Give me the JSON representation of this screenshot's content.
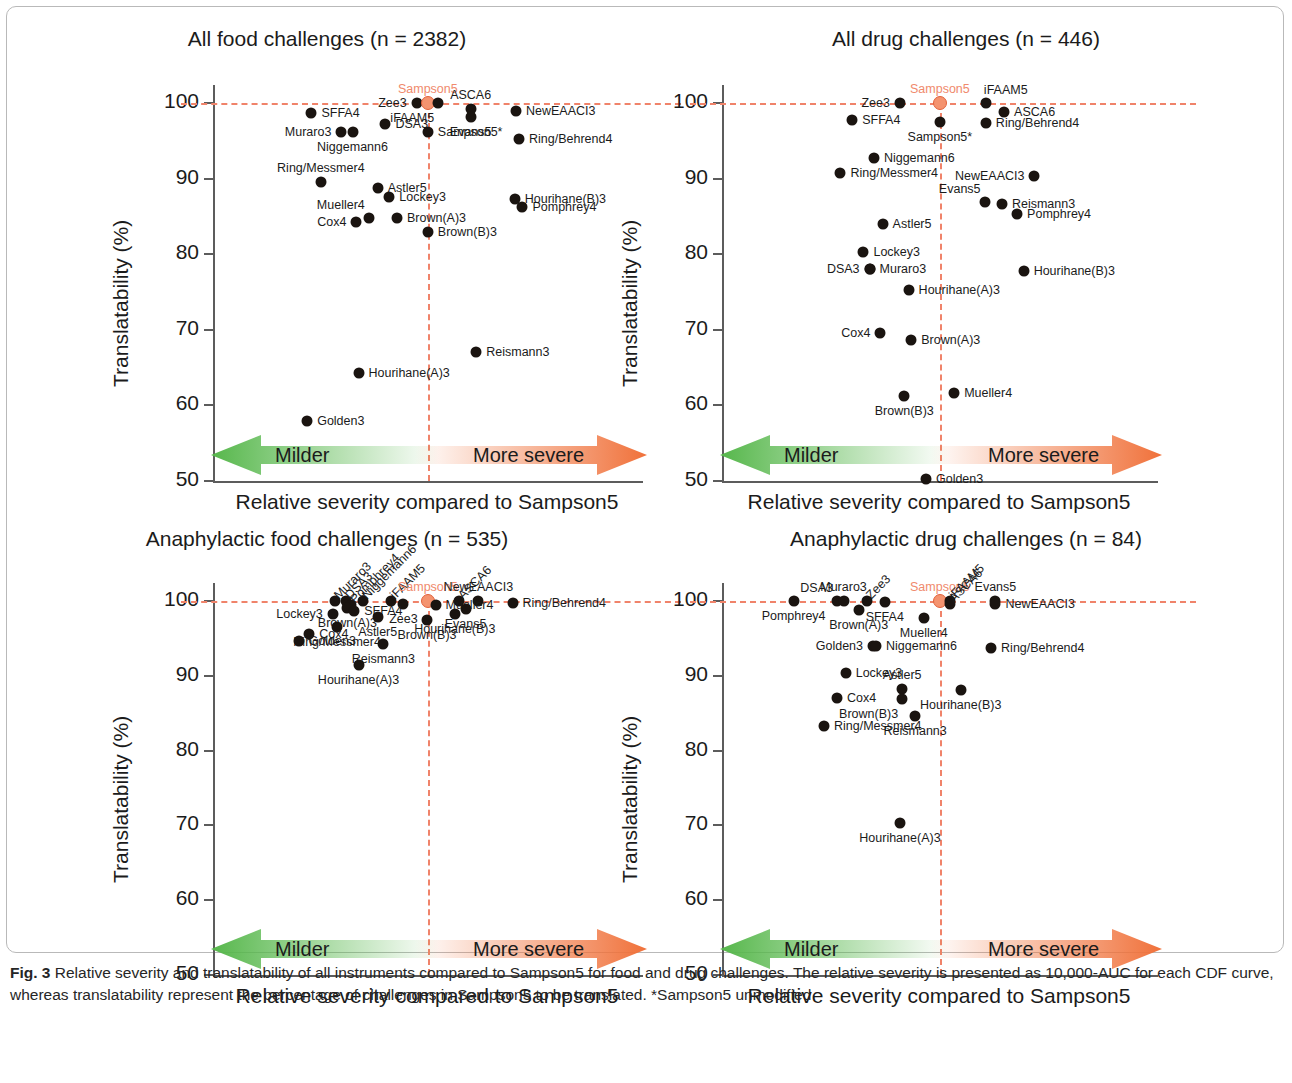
{
  "figure": {
    "caption_label": "Fig. 3",
    "caption_text": "Relative severity and translatability of all instruments compared to Sampson5 for food and drug challenges. The relative severity is presented as 10,000-AUC for each CDF curve, whereas translatability represent the percentage of challenges in Sampson5 to be translated. *Sampson5 unmodified",
    "accent_color": "#f0836a",
    "marker_color": "#1a1410",
    "sampson_marker_color": "#f4936f",
    "milder_arrow_color": "#56b74b",
    "severe_arrow_color": "#f0713a"
  },
  "common": {
    "xlabel": "Relative severity compared to Sampson5",
    "ylabel": "Translatability (%)",
    "milder_label": "Milder",
    "more_severe_label": "More severe"
  },
  "chart_data": [
    {
      "id": "all-food",
      "type": "scatter",
      "title": "All food challenges (n = 2382)",
      "xlabel": "Relative severity compared to Sampson5",
      "ylabel": "Translatability (%)",
      "ylim": [
        50,
        100
      ],
      "yticks": [
        50,
        60,
        70,
        80,
        90,
        100
      ],
      "xlim": [
        0,
        100
      ],
      "grid": false,
      "reference_lines": {
        "horizontal_y": 100,
        "vertical_x": 50.2,
        "style": "dashed"
      },
      "points": [
        {
          "name": "SFFA4",
          "x": 23.0,
          "y": 98.7,
          "label_pos": "right"
        },
        {
          "name": "Muraro3",
          "x": 30.0,
          "y": 96.2,
          "label_pos": "left"
        },
        {
          "name": "Niggemann6",
          "x": 32.6,
          "y": 96.2,
          "label_pos": "below"
        },
        {
          "name": "DSA3",
          "x": 40.3,
          "y": 97.2,
          "label_pos": "right"
        },
        {
          "name": "Zee3",
          "x": 47.6,
          "y": 100.0,
          "label_pos": "left"
        },
        {
          "name": "Sampson5",
          "x": 50.2,
          "y": 100.0,
          "label_pos": "above",
          "highlight": true
        },
        {
          "name": "iFAAM5",
          "x": 52.6,
          "y": 100.0,
          "label_pos": "below-left"
        },
        {
          "name": "ASCA6",
          "x": 60.2,
          "y": 99.2,
          "label_pos": "above"
        },
        {
          "name": "Evans5",
          "x": 60.2,
          "y": 98.2,
          "label_pos": "below"
        },
        {
          "name": "NewEAACI3",
          "x": 70.8,
          "y": 98.9,
          "label_pos": "right"
        },
        {
          "name": "Sampson5*",
          "x": 50.2,
          "y": 96.2,
          "label_pos": "right"
        },
        {
          "name": "Ring/Behrend4",
          "x": 71.5,
          "y": 95.3,
          "label_pos": "right"
        },
        {
          "name": "Ring/Messmer4",
          "x": 25.2,
          "y": 89.6,
          "label_pos": "above"
        },
        {
          "name": "Astler5",
          "x": 38.5,
          "y": 88.8,
          "label_pos": "right"
        },
        {
          "name": "Lockey3",
          "x": 41.2,
          "y": 87.6,
          "label_pos": "right"
        },
        {
          "name": "Hourihane(B)3",
          "x": 70.5,
          "y": 87.3,
          "label_pos": "right"
        },
        {
          "name": "Pomphrey4",
          "x": 72.3,
          "y": 86.3,
          "label_pos": "right"
        },
        {
          "name": "Cox4",
          "x": 33.5,
          "y": 84.3,
          "label_pos": "left"
        },
        {
          "name": "Mueller4",
          "x": 36.4,
          "y": 84.8,
          "label_pos": "above-left"
        },
        {
          "name": "Brown(A)3",
          "x": 43.0,
          "y": 84.8,
          "label_pos": "right"
        },
        {
          "name": "Brown(B)3",
          "x": 50.2,
          "y": 83.0,
          "label_pos": "right"
        },
        {
          "name": "Reismann3",
          "x": 61.5,
          "y": 67.0,
          "label_pos": "right"
        },
        {
          "name": "Hourihane(A)3",
          "x": 34.0,
          "y": 64.3,
          "label_pos": "right"
        },
        {
          "name": "Golden3",
          "x": 22.0,
          "y": 58.0,
          "label_pos": "right"
        }
      ]
    },
    {
      "id": "all-drug",
      "type": "scatter",
      "title": "All drug challenges (n = 446)",
      "xlabel": "Relative severity compared to Sampson5",
      "ylabel": "Translatability (%)",
      "ylim": [
        50,
        100
      ],
      "yticks": [
        50,
        60,
        70,
        80,
        90,
        100
      ],
      "xlim": [
        0,
        100
      ],
      "grid": false,
      "reference_lines": {
        "horizontal_y": 100,
        "vertical_x": 50.2,
        "style": "dashed"
      },
      "points": [
        {
          "name": "Zee3",
          "x": 41.0,
          "y": 100.0,
          "label_pos": "left"
        },
        {
          "name": "Sampson5",
          "x": 50.2,
          "y": 100.0,
          "label_pos": "above",
          "highlight": true
        },
        {
          "name": "iFAAM5",
          "x": 60.8,
          "y": 100.0,
          "label_pos": "above-right"
        },
        {
          "name": "ASCA6",
          "x": 65.0,
          "y": 98.8,
          "label_pos": "right"
        },
        {
          "name": "Ring/Behrend4",
          "x": 60.8,
          "y": 97.3,
          "label_pos": "right"
        },
        {
          "name": "SFFA4",
          "x": 30.0,
          "y": 97.8,
          "label_pos": "right"
        },
        {
          "name": "Sampson5*",
          "x": 50.2,
          "y": 97.5,
          "label_pos": "below"
        },
        {
          "name": "Niggemann6",
          "x": 35.0,
          "y": 92.7,
          "label_pos": "right"
        },
        {
          "name": "Ring/Messmer4",
          "x": 27.3,
          "y": 90.7,
          "label_pos": "right"
        },
        {
          "name": "NewEAACI3",
          "x": 72.0,
          "y": 90.3,
          "label_pos": "left"
        },
        {
          "name": "Evans5",
          "x": 60.5,
          "y": 86.9,
          "label_pos": "above-left"
        },
        {
          "name": "Reismann3",
          "x": 64.5,
          "y": 86.7,
          "label_pos": "right"
        },
        {
          "name": "Pomphrey4",
          "x": 68.0,
          "y": 85.3,
          "label_pos": "right"
        },
        {
          "name": "Astler5",
          "x": 37.0,
          "y": 84.0,
          "label_pos": "right"
        },
        {
          "name": "Lockey3",
          "x": 32.6,
          "y": 80.3,
          "label_pos": "right"
        },
        {
          "name": "Muraro3",
          "x": 34.0,
          "y": 78.0,
          "label_pos": "right"
        },
        {
          "name": "DSA3",
          "x": 34.0,
          "y": 78.0,
          "label_pos": "left"
        },
        {
          "name": "Hourihane(B)3",
          "x": 69.5,
          "y": 77.8,
          "label_pos": "right"
        },
        {
          "name": "Hourihane(A)3",
          "x": 43.0,
          "y": 75.3,
          "label_pos": "right"
        },
        {
          "name": "Cox4",
          "x": 36.5,
          "y": 69.6,
          "label_pos": "left"
        },
        {
          "name": "Brown(A)3",
          "x": 43.6,
          "y": 68.7,
          "label_pos": "right"
        },
        {
          "name": "Mueller4",
          "x": 53.5,
          "y": 61.6,
          "label_pos": "right"
        },
        {
          "name": "Brown(B)3",
          "x": 42.0,
          "y": 61.2,
          "label_pos": "below"
        },
        {
          "name": "Golden3",
          "x": 47.0,
          "y": 50.2,
          "label_pos": "right"
        }
      ]
    },
    {
      "id": "anaphylactic-food",
      "type": "scatter",
      "title": "Anaphylactic food challenges (n = 535)",
      "xlabel": "Relative severity compared to Sampson5",
      "ylabel": "Translatability (%)",
      "ylim": [
        50,
        100
      ],
      "yticks": [
        50,
        60,
        70,
        80,
        90,
        100
      ],
      "xlim": [
        0,
        100
      ],
      "grid": false,
      "reference_lines": {
        "horizontal_y": 100,
        "vertical_x": 50.2,
        "style": "dashed"
      },
      "points": [
        {
          "name": "Muraro3",
          "x": 28.5,
          "y": 100.0,
          "label_pos": "rot"
        },
        {
          "name": "DSA3",
          "x": 31.0,
          "y": 100.0,
          "label_pos": "rot"
        },
        {
          "name": "Pomphrey4",
          "x": 32.2,
          "y": 99.4,
          "label_pos": "rot"
        },
        {
          "name": "Niggemann6",
          "x": 35.0,
          "y": 100.0,
          "label_pos": "rot"
        },
        {
          "name": "iFAAM5",
          "x": 41.5,
          "y": 100.0,
          "label_pos": "rot"
        },
        {
          "name": "Sampson5",
          "x": 50.2,
          "y": 100.0,
          "label_pos": "above",
          "highlight": true
        },
        {
          "name": "ASCA6",
          "x": 57.5,
          "y": 100.0,
          "label_pos": "rot"
        },
        {
          "name": "NewEAACI3",
          "x": 62.0,
          "y": 100.0,
          "label_pos": "above"
        },
        {
          "name": "Zee3",
          "x": 44.5,
          "y": 99.6,
          "label_pos": "below"
        },
        {
          "name": "Mueller4",
          "x": 52.0,
          "y": 99.5,
          "label_pos": "right"
        },
        {
          "name": "Evans5",
          "x": 59.0,
          "y": 98.9,
          "label_pos": "below"
        },
        {
          "name": "Ring/Behrend4",
          "x": 70.0,
          "y": 99.7,
          "label_pos": "right"
        },
        {
          "name": "Lockey3",
          "x": 28.0,
          "y": 98.2,
          "label_pos": "left"
        },
        {
          "name": "Brown(A)3",
          "x": 31.4,
          "y": 99.0,
          "label_pos": "below"
        },
        {
          "name": "SFFA4",
          "x": 33.0,
          "y": 98.7,
          "label_pos": "right"
        },
        {
          "name": "Astler5",
          "x": 38.5,
          "y": 97.8,
          "label_pos": "below"
        },
        {
          "name": "Brown(B)3",
          "x": 50.0,
          "y": 97.5,
          "label_pos": "below"
        },
        {
          "name": "Hourihane(B)3",
          "x": 56.5,
          "y": 98.3,
          "label_pos": "below"
        },
        {
          "name": "Ring/Messmer4",
          "x": 29.0,
          "y": 96.5,
          "label_pos": "below"
        },
        {
          "name": "Cox4",
          "x": 22.5,
          "y": 95.6,
          "label_pos": "right"
        },
        {
          "name": "Golden3",
          "x": 20.0,
          "y": 94.7,
          "label_pos": "right"
        },
        {
          "name": "Reismann3",
          "x": 39.8,
          "y": 94.3,
          "label_pos": "below"
        },
        {
          "name": "Hourihane(A)3",
          "x": 34.0,
          "y": 91.4,
          "label_pos": "below"
        }
      ]
    },
    {
      "id": "anaphylactic-drug",
      "type": "scatter",
      "title": "Anaphylactic drug challenges (n = 84)",
      "xlabel": "Relative severity compared to Sampson5",
      "ylabel": "Translatability (%)",
      "ylim": [
        50,
        100
      ],
      "yticks": [
        50,
        60,
        70,
        80,
        90,
        100
      ],
      "xlim": [
        0,
        100
      ],
      "grid": false,
      "reference_lines": {
        "horizontal_y": 100,
        "vertical_x": 50.2,
        "style": "dashed"
      },
      "points": [
        {
          "name": "Pomphrey4",
          "x": 16.5,
          "y": 100.0,
          "label_pos": "below"
        },
        {
          "name": "DSA3",
          "x": 26.5,
          "y": 100.0,
          "label_pos": "above-left"
        },
        {
          "name": "Muraro3",
          "x": 28.0,
          "y": 100.0,
          "label_pos": "above"
        },
        {
          "name": "Zee3",
          "x": 33.5,
          "y": 100.0,
          "label_pos": "rot"
        },
        {
          "name": "Brown(A)3",
          "x": 31.5,
          "y": 98.8,
          "label_pos": "below"
        },
        {
          "name": "SFFA4",
          "x": 37.5,
          "y": 99.8,
          "label_pos": "below"
        },
        {
          "name": "Sampson5",
          "x": 50.2,
          "y": 100.0,
          "label_pos": "above",
          "highlight": true
        },
        {
          "name": "iFAAM5",
          "x": 52.5,
          "y": 100.0,
          "label_pos": "rot"
        },
        {
          "name": "ASCA6",
          "x": 52.5,
          "y": 99.6,
          "label_pos": "rot"
        },
        {
          "name": "Evans5",
          "x": 63.0,
          "y": 100.0,
          "label_pos": "above"
        },
        {
          "name": "NewEAACI3",
          "x": 63.0,
          "y": 99.6,
          "label_pos": "right"
        },
        {
          "name": "Mueller4",
          "x": 46.5,
          "y": 97.7,
          "label_pos": "below"
        },
        {
          "name": "Golden3",
          "x": 34.8,
          "y": 94.0,
          "label_pos": "left"
        },
        {
          "name": "Niggemann6",
          "x": 35.5,
          "y": 94.0,
          "label_pos": "right"
        },
        {
          "name": "Ring/Behrend4",
          "x": 62.0,
          "y": 93.7,
          "label_pos": "right"
        },
        {
          "name": "Lockey3",
          "x": 28.5,
          "y": 90.4,
          "label_pos": "right"
        },
        {
          "name": "Astler5",
          "x": 41.5,
          "y": 88.3,
          "label_pos": "above"
        },
        {
          "name": "Hourihane(B)3",
          "x": 55.0,
          "y": 88.1,
          "label_pos": "below"
        },
        {
          "name": "Cox4",
          "x": 26.5,
          "y": 87.0,
          "label_pos": "right"
        },
        {
          "name": "Brown(B)3",
          "x": 41.5,
          "y": 86.9,
          "label_pos": "below-left"
        },
        {
          "name": "Reismann3",
          "x": 44.5,
          "y": 84.6,
          "label_pos": "below"
        },
        {
          "name": "Ring/Messmer4",
          "x": 23.5,
          "y": 83.3,
          "label_pos": "right"
        },
        {
          "name": "Hourihane(A)3",
          "x": 41.0,
          "y": 70.3,
          "label_pos": "below"
        }
      ]
    }
  ]
}
